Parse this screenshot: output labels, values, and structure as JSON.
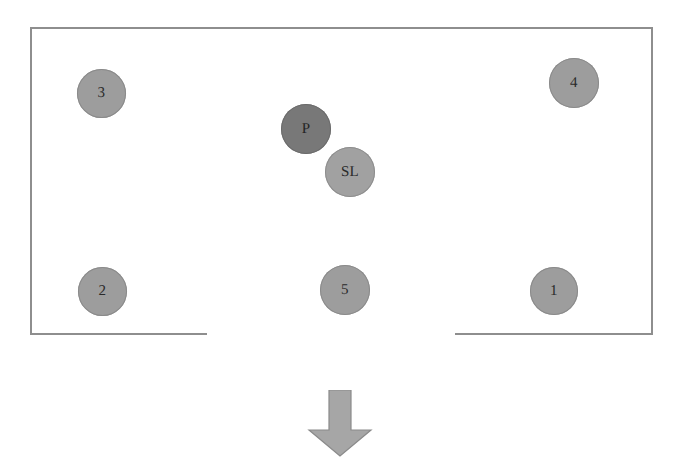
{
  "scene": {
    "title": "Room layout diagram with labelled circular positions and a downward arrow",
    "background_color": "#ffffff"
  },
  "room": {
    "name": "enclosure",
    "border_color": "#8e8e8e",
    "has_bottom_opening": true,
    "opening_label": "exit gap in bottom wall"
  },
  "nodes": [
    {
      "id": "node-3",
      "label": "3",
      "kind": "numbered",
      "fill": "#9d9d9d",
      "left": 77,
      "top": 69,
      "size": 49
    },
    {
      "id": "node-4",
      "label": "4",
      "kind": "numbered",
      "fill": "#9d9d9d",
      "left": 549,
      "top": 58,
      "size": 50
    },
    {
      "id": "node-p",
      "label": "P",
      "kind": "dark",
      "fill": "#787878",
      "left": 281,
      "top": 104,
      "size": 50
    },
    {
      "id": "node-sl",
      "label": "SL",
      "kind": "light",
      "fill": "#a1a1a1",
      "left": 325,
      "top": 147,
      "size": 50
    },
    {
      "id": "node-2",
      "label": "2",
      "kind": "numbered",
      "fill": "#9d9d9d",
      "left": 78,
      "top": 267,
      "size": 49
    },
    {
      "id": "node-5",
      "label": "5",
      "kind": "numbered",
      "fill": "#9d9d9d",
      "left": 320,
      "top": 265,
      "size": 50
    },
    {
      "id": "node-1",
      "label": "1",
      "kind": "numbered",
      "fill": "#9d9d9d",
      "left": 530,
      "top": 267,
      "size": 48
    }
  ],
  "arrow": {
    "name": "down-arrow",
    "direction": "down",
    "fill": "#a6a6a6",
    "stroke": "#8a8a8a"
  }
}
